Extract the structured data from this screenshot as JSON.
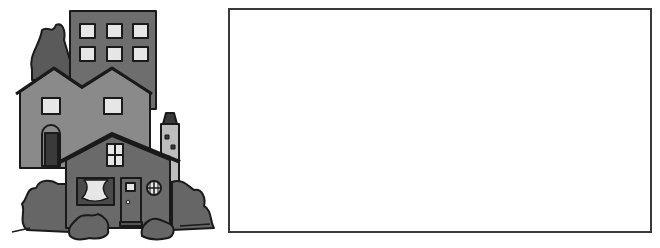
{
  "illustration": {
    "subject": "neighborhood-buildings-clipart",
    "colors": {
      "outline": "#1a1a1a",
      "apartment": "#6e6e6e",
      "house_back": "#8a8a8a",
      "house_front": "#6a6a6a",
      "tree": "#5a5a5a",
      "bush": "#666666",
      "window": "#e6e6e6",
      "door": "#3a3a3a"
    }
  },
  "blank_box": {
    "border_color": "#3a3a3a",
    "fill": "#ffffff"
  }
}
